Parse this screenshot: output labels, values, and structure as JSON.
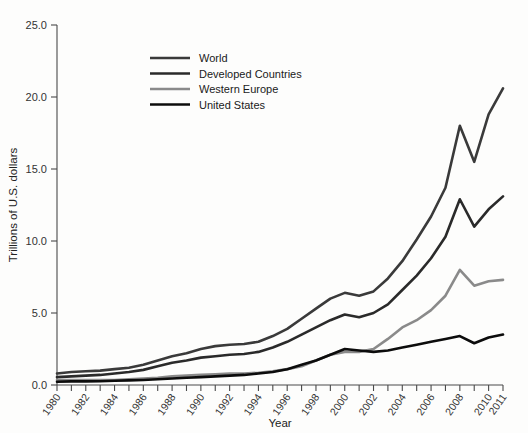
{
  "chart_data": {
    "type": "line",
    "title": "",
    "xlabel": "Year",
    "ylabel": "Trillions of U.S. dollars",
    "ylim": [
      0,
      25
    ],
    "xlim": [
      1980,
      2011
    ],
    "yticks": [
      "0.0",
      "5.0",
      "10.0",
      "15.0",
      "20.0",
      "25.0"
    ],
    "ytick_values": [
      0,
      5,
      10,
      15,
      20,
      25
    ],
    "xticks": [
      "1980",
      "1982",
      "1984",
      "1986",
      "1988",
      "1990",
      "1992",
      "1994",
      "1996",
      "1998",
      "2000",
      "2002",
      "2004",
      "2006",
      "2008",
      "2010",
      "2011"
    ],
    "grid": false,
    "legend_position": "upper-left-inside",
    "x": [
      1980,
      1981,
      1982,
      1983,
      1984,
      1985,
      1986,
      1987,
      1988,
      1989,
      1990,
      1991,
      1992,
      1993,
      1994,
      1995,
      1996,
      1997,
      1998,
      1999,
      2000,
      2001,
      2002,
      2003,
      2004,
      2005,
      2006,
      2007,
      2008,
      2009,
      2010,
      2011
    ],
    "series": [
      {
        "name": "World",
        "color": "#3a3a3a",
        "width": 2.6,
        "values": [
          0.8,
          0.9,
          0.95,
          1.0,
          1.1,
          1.2,
          1.4,
          1.7,
          2.0,
          2.2,
          2.5,
          2.7,
          2.8,
          2.85,
          3.0,
          3.4,
          3.9,
          4.6,
          5.3,
          6.0,
          6.4,
          6.2,
          6.5,
          7.4,
          8.6,
          10.1,
          11.7,
          13.7,
          18.0,
          15.5,
          18.8,
          20.6
        ]
      },
      {
        "name": "Developed Countries",
        "color": "#2a2a2a",
        "width": 2.6,
        "values": [
          0.55,
          0.6,
          0.65,
          0.7,
          0.8,
          0.9,
          1.05,
          1.3,
          1.55,
          1.7,
          1.9,
          2.0,
          2.1,
          2.15,
          2.3,
          2.6,
          3.0,
          3.5,
          4.0,
          4.5,
          4.9,
          4.7,
          5.0,
          5.6,
          6.6,
          7.6,
          8.8,
          10.3,
          12.9,
          11.0,
          12.2,
          13.1
        ]
      },
      {
        "name": "Western Europe",
        "color": "#8a8a8a",
        "width": 2.6,
        "values": [
          0.35,
          0.35,
          0.35,
          0.35,
          0.35,
          0.4,
          0.45,
          0.5,
          0.6,
          0.65,
          0.7,
          0.75,
          0.8,
          0.8,
          0.85,
          0.95,
          1.1,
          1.3,
          1.7,
          2.1,
          2.3,
          2.3,
          2.5,
          3.2,
          4.0,
          4.5,
          5.2,
          6.2,
          8.0,
          6.9,
          7.2,
          7.3
        ]
      },
      {
        "name": "United States",
        "color": "#0c0c0c",
        "width": 2.6,
        "values": [
          0.23,
          0.25,
          0.25,
          0.26,
          0.3,
          0.32,
          0.35,
          0.4,
          0.45,
          0.5,
          0.55,
          0.6,
          0.65,
          0.7,
          0.8,
          0.9,
          1.1,
          1.4,
          1.7,
          2.1,
          2.5,
          2.4,
          2.3,
          2.4,
          2.6,
          2.8,
          3.0,
          3.2,
          3.4,
          2.9,
          3.3,
          3.5
        ]
      }
    ]
  },
  "legend": {
    "items": [
      {
        "label": "World"
      },
      {
        "label": "Developed Countries"
      },
      {
        "label": "Western Europe"
      },
      {
        "label": "United States"
      }
    ]
  },
  "colors": {
    "axis": "#4a4a4a",
    "text": "#333333",
    "background": "#fdfdfc"
  }
}
